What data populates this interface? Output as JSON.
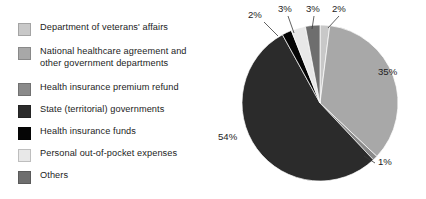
{
  "chart_data": {
    "type": "pie",
    "title": "",
    "legend_position": "left",
    "labels": [
      "Department of veterans' affairs",
      "National healthcare agreement and other government departments",
      "Health insurance premium refund",
      "State (territorial) governments",
      "Health insurance funds",
      "Personal out-of-pocket expenses",
      "Others"
    ],
    "values": [
      2,
      35,
      1,
      54,
      2,
      3,
      3
    ],
    "value_labels": [
      "2%",
      "35%",
      "1%",
      "54%",
      "2%",
      "3%",
      "3%"
    ],
    "colors": [
      "#c8c8c8",
      "#a8a8a8",
      "#8a8a8a",
      "#2b2b2b",
      "#050505",
      "#e8e8e8",
      "#6e6e6e"
    ],
    "units": "percent",
    "total": 100
  },
  "legend": {
    "items": [
      {
        "label": "Department of veterans' affairs",
        "color": "#c8c8c8",
        "two_line": false
      },
      {
        "label": "National healthcare agreement and\nother government departments",
        "color": "#a8a8a8",
        "two_line": true
      },
      {
        "label": "Health insurance premium refund",
        "color": "#8a8a8a",
        "two_line": false
      },
      {
        "label": "State (territorial) governments",
        "color": "#2b2b2b",
        "two_line": false
      },
      {
        "label": "Health insurance funds",
        "color": "#050505",
        "two_line": false
      },
      {
        "label": "Personal out-of-pocket expenses",
        "color": "#e8e8e8",
        "two_line": false
      },
      {
        "label": "Others",
        "color": "#6e6e6e",
        "two_line": false
      }
    ]
  },
  "pie": {
    "center_x": 102,
    "center_y": 103,
    "radius": 78,
    "start_angle_deg": -90,
    "slices": [
      {
        "name": "veterans-affairs",
        "value": 2,
        "color": "#c8c8c8",
        "label": "2%"
      },
      {
        "name": "national-agreement",
        "value": 35,
        "color": "#a8a8a8",
        "label": "35%"
      },
      {
        "name": "premium-refund",
        "value": 1,
        "color": "#8a8a8a",
        "label": "1%"
      },
      {
        "name": "state-governments",
        "value": 54,
        "color": "#2b2b2b",
        "label": "54%"
      },
      {
        "name": "health-insurance-funds",
        "value": 2,
        "color": "#050505",
        "label": "2%"
      },
      {
        "name": "out-of-pocket",
        "value": 3,
        "color": "#e8e8e8",
        "label": "3%"
      },
      {
        "name": "others",
        "value": 3,
        "color": "#6e6e6e",
        "label": "3%"
      }
    ]
  },
  "callouts": {
    "top": [
      {
        "text": "2%",
        "x": 30,
        "y": 18
      },
      {
        "text": "3%",
        "x": 60,
        "y": 12
      },
      {
        "text": "3%",
        "x": 88,
        "y": 12
      },
      {
        "text": "2%",
        "x": 114,
        "y": 12
      }
    ],
    "right_top": {
      "text": "35%",
      "x": 160,
      "y": 75
    },
    "right_bottom": {
      "text": "1%",
      "x": 160,
      "y": 165
    },
    "left": {
      "text": "54%",
      "x": 0,
      "y": 140
    }
  }
}
